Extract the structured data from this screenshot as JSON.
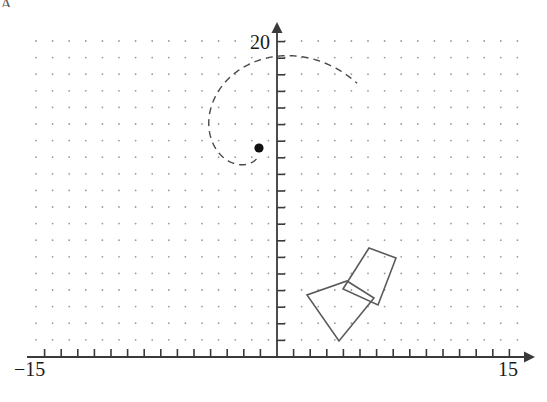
{
  "figure": {
    "background_color": "#ffffff",
    "width": 547,
    "height": 402
  },
  "axes": {
    "x_axis": {
      "label_min": "−15",
      "label_max": "15",
      "color": "#3a3a3a",
      "arrow": "right-arrowhead",
      "tick_count": 30,
      "pixel_y": 357,
      "pixel_x_start": 27,
      "pixel_x_end": 530
    },
    "y_axis": {
      "label_max": "20",
      "color": "#3a3a3a",
      "arrow": "up-arrowhead",
      "tick_count": 20,
      "pixel_x": 277,
      "pixel_y_top": 25,
      "pixel_y_bottom": 357
    },
    "origin": {
      "x": 277,
      "y": 357
    },
    "unit_pixels": 16.6
  },
  "grid": {
    "type": "dot-grid",
    "dot_color": "#9a9a9a",
    "dot_radius": 0.9,
    "spacing_px": 16.6,
    "x_start": 36,
    "x_count": 30,
    "y_start": 41,
    "y_count": 19
  },
  "center_point": {
    "name": "center-of-rotation",
    "x_px": 259,
    "y_px": 148,
    "radius_px": 4.6,
    "color": "#111111",
    "data_x": -1.1,
    "data_y": 12.6
  },
  "spiral": {
    "name": "dashed-spiral",
    "style": "dashed",
    "color": "#4a4a4a",
    "stroke_width": 1.4,
    "dash_pattern": "7 5",
    "description": "Dashed spiral winding outward from the center point, sweeping counterclockwise up and around to the right before descending into the quadrilaterals"
  },
  "shapes": [
    {
      "name": "quadrilateral-image",
      "role": "rotated image",
      "stroke": "#5a5a5a",
      "stroke_width": 1.6,
      "fill": "none",
      "points_px": [
        [
          369,
          248
        ],
        [
          396,
          258
        ],
        [
          378,
          305
        ],
        [
          343,
          289
        ]
      ]
    },
    {
      "name": "quadrilateral-preimage",
      "role": "pre-image",
      "stroke": "#5a5a5a",
      "stroke_width": 1.6,
      "fill": "none",
      "points_px": [
        [
          347,
          281
        ],
        [
          374,
          298
        ],
        [
          339,
          341
        ],
        [
          307,
          295
        ]
      ]
    }
  ],
  "corner_mark": {
    "text": "A",
    "note": "partially cropped glyph at top-left edge"
  }
}
